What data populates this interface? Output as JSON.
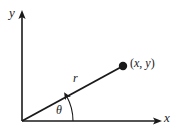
{
  "figure": {
    "type": "polar-coordinate-diagram",
    "background_color": "#ffffff",
    "stroke_color": "#1a1a1a",
    "axes": {
      "y_axis": {
        "label": "y",
        "icon": "axis-arrow-up-icon",
        "origin": [
          22,
          121
        ],
        "tip": [
          22,
          12
        ]
      },
      "x_axis": {
        "label": "x",
        "icon": "axis-arrow-right-icon",
        "origin": [
          22,
          121
        ],
        "tip": [
          161,
          121
        ]
      }
    },
    "ray": {
      "label": "r",
      "from": [
        22,
        121
      ],
      "to": [
        123,
        66
      ]
    },
    "point": {
      "label": "(x, y)",
      "open_paren": "(",
      "x_symbol": "x",
      "comma": ",",
      "y_symbol": "y",
      "close_paren": ")",
      "marker": "filled-dot",
      "position": [
        123,
        66
      ]
    },
    "angle": {
      "label": "θ",
      "vertex": [
        22,
        121
      ],
      "arc_radius": 51,
      "degrees": 28.6,
      "arrow": "arc-arrowhead-icon"
    }
  }
}
